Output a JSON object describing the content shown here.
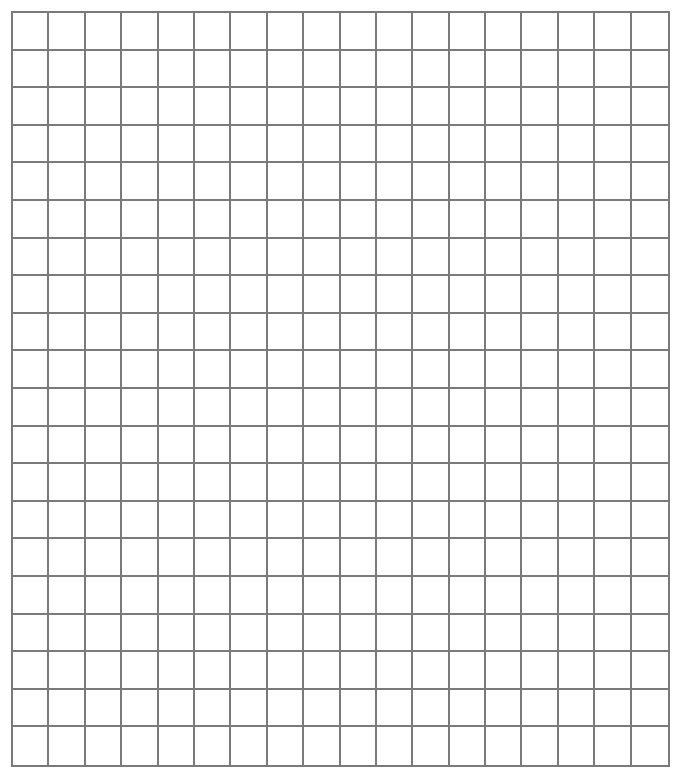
{
  "grid": {
    "columns": 18,
    "rows": 20,
    "line_color": "#7a7a7a",
    "background_color": "#ffffff"
  }
}
